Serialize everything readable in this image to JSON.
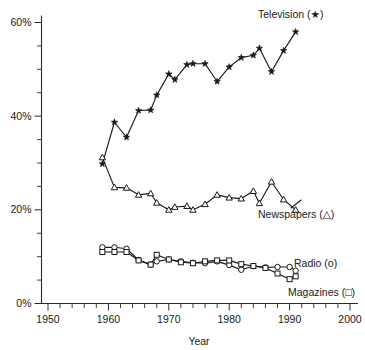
{
  "chart_data": {
    "type": "line",
    "title": "",
    "subtitle": "",
    "xlabel": "Year",
    "ylabel": "",
    "xlim": [
      1948,
      2002
    ],
    "ylim": [
      0,
      62
    ],
    "grid": false,
    "legend_position": "inline-right-of-series",
    "x_ticks": [
      1950,
      1960,
      1970,
      1980,
      1990,
      2000
    ],
    "x_tick_labels": [
      "1950",
      "1960",
      "1970",
      "1980",
      "1990",
      "2000"
    ],
    "x_minor_step": 2,
    "y_ticks": [
      0,
      20,
      40,
      60
    ],
    "y_tick_labels": [
      "0%",
      "20%",
      "40%",
      "60%"
    ],
    "y_minor_step": 5,
    "series": [
      {
        "name": "Television",
        "label": "Television (★)",
        "marker": "star",
        "x": [
          1959,
          1961,
          1963,
          1965,
          1967,
          1968,
          1970,
          1971,
          1973,
          1974,
          1976,
          1978,
          1980,
          1982,
          1984,
          1985,
          1987,
          1989,
          1991
        ],
        "values": [
          29.8,
          38.7,
          35.5,
          41.2,
          41.3,
          44.5,
          49.0,
          47.8,
          51.0,
          51.2,
          51.2,
          47.4,
          50.5,
          52.5,
          53.0,
          54.5,
          49.5,
          54.0,
          58.0
        ]
      },
      {
        "name": "Newspapers",
        "label": "Newspapers (△)",
        "marker": "triangle",
        "x": [
          1959,
          1961,
          1963,
          1965,
          1967,
          1968,
          1970,
          1971,
          1973,
          1974,
          1976,
          1978,
          1980,
          1982,
          1984,
          1985,
          1987,
          1989,
          1991
        ],
        "values": [
          31.2,
          24.8,
          24.7,
          23.2,
          23.5,
          21.5,
          20.0,
          20.6,
          20.8,
          20.0,
          21.2,
          23.2,
          22.6,
          22.4,
          24.0,
          21.4,
          26.0,
          22.2,
          20.0
        ]
      },
      {
        "name": "Radio",
        "label": "Radio (o)",
        "marker": "circle",
        "x": [
          1959,
          1961,
          1963,
          1965,
          1967,
          1968,
          1970,
          1972,
          1974,
          1976,
          1978,
          1980,
          1982,
          1984,
          1986,
          1988,
          1990,
          1991
        ],
        "values": [
          12.0,
          12.0,
          11.7,
          9.3,
          8.3,
          9.0,
          9.4,
          9.0,
          8.7,
          8.6,
          9.0,
          8.2,
          7.2,
          8.0,
          7.7,
          7.8,
          7.8,
          7.0
        ]
      },
      {
        "name": "Magazines",
        "label": "Magazines (□)",
        "marker": "square",
        "x": [
          1959,
          1961,
          1963,
          1965,
          1967,
          1968,
          1970,
          1972,
          1974,
          1976,
          1978,
          1980,
          1982,
          1984,
          1986,
          1988,
          1990,
          1991
        ],
        "values": [
          11.0,
          11.0,
          11.0,
          9.2,
          8.3,
          10.4,
          9.4,
          8.8,
          8.6,
          9.0,
          9.2,
          9.2,
          8.4,
          8.0,
          7.6,
          6.4,
          5.2,
          5.8
        ]
      }
    ]
  },
  "labels": {
    "television": "Television (★)",
    "newspapers": "Newspapers (△)",
    "radio": "Radio (o)",
    "magazines": "Magazines (□)",
    "x_axis_title": "Year"
  },
  "colors": {
    "ink": "#1a1a1a",
    "axis": "#2b2b2b",
    "background": "#ffffff",
    "marker_fill": "#ffffff"
  }
}
